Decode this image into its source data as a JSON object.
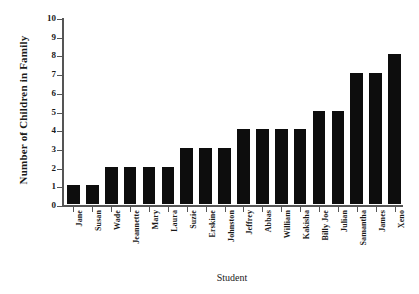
{
  "chart_data": {
    "type": "bar",
    "title": "",
    "xlabel": "Student",
    "ylabel": "Number of Children in Family",
    "categories": [
      "Jane",
      "Susan",
      "Wade",
      "Jeannette",
      "Mary",
      "Laura",
      "Suzie",
      "Erskine",
      "Johnston",
      "Jeffrey",
      "Abbas",
      "William",
      "Kakisha",
      "Billy Joe",
      "Julian",
      "Samantha",
      "James",
      "Xeno"
    ],
    "values": [
      1,
      1,
      2,
      2,
      2,
      2,
      3,
      3,
      3,
      4,
      4,
      4,
      4,
      5,
      5,
      7,
      7,
      8
    ],
    "ylim": [
      0,
      10
    ],
    "yticks": [
      0,
      1,
      2,
      3,
      4,
      5,
      6,
      7,
      8,
      9,
      10
    ],
    "ytick_labels": [
      "0",
      "1",
      "2",
      "3",
      "4",
      "5",
      "6",
      "7",
      "8",
      "9",
      "10"
    ],
    "grid": false,
    "legend": null,
    "bar_color": "#0d0d0d",
    "axis_color": "#555555",
    "background_color": "#ffffff"
  }
}
